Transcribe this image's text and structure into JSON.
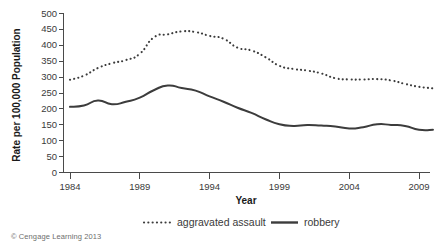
{
  "credit": "© Cengage Learning 2013",
  "axes": {
    "x_title": "Year",
    "y_title": "Rate per 100,000 Population",
    "x_ticks": [
      "1984",
      "1989",
      "1994",
      "1999",
      "2004",
      "2009"
    ],
    "y_ticks": [
      "500",
      "450",
      "400",
      "350",
      "300",
      "250",
      "200",
      "150",
      "100",
      "50",
      "0"
    ]
  },
  "legend": {
    "items": [
      {
        "label": "aggravated assault",
        "style": "dotted",
        "color": "#3c3c3c"
      },
      {
        "label": "robbery",
        "style": "solid",
        "color": "#3c3c3c"
      }
    ]
  },
  "chart_data": {
    "type": "line",
    "title": "",
    "subtitle": "",
    "xlabel": "Year",
    "ylabel": "Rate per 100,000 Population",
    "xlim": [
      1984,
      2010
    ],
    "ylim": [
      0,
      500
    ],
    "ytick_step": 50,
    "xtick_values": [
      1984,
      1989,
      1994,
      1999,
      2004,
      2009
    ],
    "grid": false,
    "legend_position": "bottom",
    "x": [
      1984,
      1985,
      1986,
      1987,
      1988,
      1989,
      1990,
      1991,
      1992,
      1993,
      1994,
      1995,
      1996,
      1997,
      1998,
      1999,
      2000,
      2001,
      2002,
      2003,
      2004,
      2005,
      2006,
      2007,
      2008,
      2009,
      2010
    ],
    "series": [
      {
        "name": "aggravated assault",
        "style": "dotted",
        "color": "#3c3c3c",
        "values": [
          290,
          303,
          327,
          342,
          352,
          372,
          423,
          433,
          442,
          440,
          428,
          419,
          391,
          382,
          361,
          334,
          324,
          319,
          310,
          295,
          291,
          291,
          292,
          288,
          277,
          268,
          263
        ]
      },
      {
        "name": "robbery",
        "style": "solid",
        "color": "#3c3c3c",
        "values": [
          205,
          209,
          225,
          213,
          221,
          234,
          257,
          272,
          264,
          256,
          238,
          221,
          202,
          186,
          166,
          150,
          145,
          148,
          146,
          143,
          137,
          141,
          150,
          148,
          145,
          133,
          133
        ]
      }
    ]
  }
}
